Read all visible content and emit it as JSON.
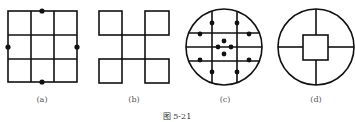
{
  "figure": {
    "caption": "图 5-21",
    "panels": [
      {
        "id": "a",
        "label": "(a)",
        "description": "3x3 square grid with dots at midpoints of top, bottom, left, right edges"
      },
      {
        "id": "b",
        "label": "(b)",
        "description": "four corner squares connected by a central square"
      },
      {
        "id": "c",
        "label": "(c)",
        "description": "circle with 2 vertical and 3 horizontal chords, 12 dots"
      },
      {
        "id": "d",
        "label": "(d)",
        "description": "circle with central square and four spokes"
      }
    ]
  },
  "colors": {
    "stroke": "#111111",
    "background": "#ffffff",
    "label": "#555555"
  }
}
